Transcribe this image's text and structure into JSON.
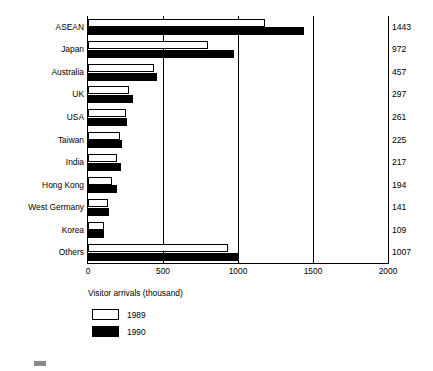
{
  "chart_data": {
    "type": "bar",
    "orientation": "horizontal",
    "title": "",
    "xlabel": "Visitor arrivals (thousand)",
    "ylabel": "",
    "xlim": [
      0,
      2000
    ],
    "grid": true,
    "gridlines": [
      0,
      500,
      1000,
      1500,
      2000
    ],
    "xticks": [
      0,
      500,
      1000,
      1500,
      2000
    ],
    "xticklabels": [
      "0",
      "500",
      "1000",
      "1500",
      "2000"
    ],
    "legend_position": "below-axis-left",
    "categories": [
      "ASEAN",
      "Japan",
      "Australia",
      "UK",
      "USA",
      "Taiwan",
      "India",
      "Hong Kong",
      "West Germany",
      "Korea",
      "Others"
    ],
    "series": [
      {
        "name": "1989",
        "style": "hollow",
        "values": [
          1180,
          800,
          437,
          270,
          250,
          215,
          195,
          160,
          130,
          105,
          935
        ]
      },
      {
        "name": "1990",
        "style": "filled",
        "values": [
          1443,
          972,
          457,
          297,
          261,
          225,
          217,
          194,
          141,
          109,
          1007
        ]
      }
    ],
    "data_labels": {
      "series": "1990",
      "position": "right-of-plot",
      "values": [
        "1443",
        "972",
        "457",
        "297",
        "261",
        "225",
        "217",
        "194",
        "141",
        "109",
        "1007"
      ]
    }
  },
  "legend": {
    "items": [
      {
        "label": "1989",
        "swatch": "hollow"
      },
      {
        "label": "1990",
        "swatch": "filled"
      }
    ]
  },
  "colors": {
    "series_1989": "#ffffff",
    "series_1990": "#000000",
    "axis": "#000000",
    "background": "#ffffff"
  }
}
